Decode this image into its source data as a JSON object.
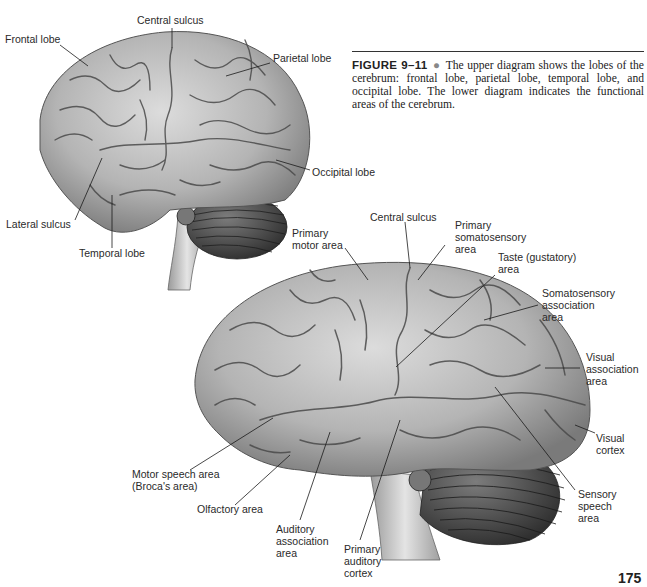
{
  "caption": {
    "figure_label": "FIGURE 9–11",
    "bullet": "●",
    "text": "The upper diagram shows the lobes of the cerebrum: frontal lobe, parietal lobe, temporal lobe, and occipital lobe. The lower diagram indicates the functional areas of the cerebrum."
  },
  "upper_diagram": {
    "labels": {
      "central_sulcus": "Central sulcus",
      "frontal_lobe": "Frontal lobe",
      "parietal_lobe": "Parietal lobe",
      "occipital_lobe": "Occipital lobe",
      "lateral_sulcus": "Lateral sulcus",
      "temporal_lobe": "Temporal lobe"
    }
  },
  "lower_diagram": {
    "labels": {
      "central_sulcus": "Central sulcus",
      "primary_motor_area": [
        "Primary",
        "motor area"
      ],
      "primary_somatosensory_area": [
        "Primary",
        "somatosensory",
        "area"
      ],
      "taste_area": [
        "Taste (gustatory)",
        "area"
      ],
      "somatosensory_association_area": [
        "Somatosensory",
        "association",
        "area"
      ],
      "visual_association_area": [
        "Visual",
        "association",
        "area"
      ],
      "visual_cortex": [
        "Visual",
        "cortex"
      ],
      "sensory_speech_area": [
        "Sensory",
        "speech",
        "area"
      ],
      "motor_speech_area": [
        "Motor speech area",
        "(Broca's area)"
      ],
      "olfactory_area": "Olfactory area",
      "auditory_association_area": [
        "Auditory",
        "association",
        "area"
      ],
      "primary_auditory_cortex": [
        "Primary",
        "auditory",
        "cortex"
      ]
    }
  },
  "page_number": "175"
}
